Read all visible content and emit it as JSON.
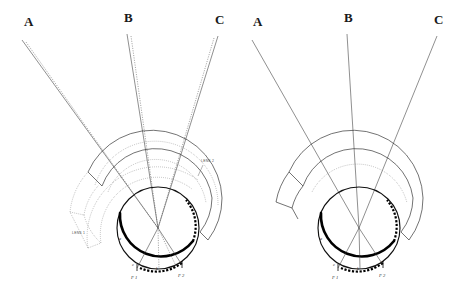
{
  "figure": {
    "background_color": "#ffffff",
    "ink_color": "#111111"
  },
  "panels": [
    {
      "id": "left",
      "name": "panel-with-rotated-lens",
      "ray_labels": [
        {
          "id": "A",
          "text": "A",
          "x": 24,
          "y": 26
        },
        {
          "id": "B",
          "text": "B",
          "x": 124,
          "y": 22
        },
        {
          "id": "C",
          "text": "C",
          "x": 215,
          "y": 24
        }
      ],
      "lens_labels": [
        {
          "id": "lens-2",
          "text": "LENS 2",
          "x": 201,
          "y": 162
        },
        {
          "id": "lens-1",
          "text": "LENS 1",
          "x": 72,
          "y": 234
        }
      ],
      "focus_labels": [
        {
          "id": "F1",
          "text": "F 1",
          "x": 136,
          "y": 277
        },
        {
          "id": "F2",
          "text": "F 2",
          "x": 183,
          "y": 275
        }
      ],
      "retina_marks": [
        {
          "id": "c",
          "text": "c",
          "x": 134,
          "y": 266
        },
        {
          "id": "b",
          "text": "b",
          "x": 158,
          "y": 269
        },
        {
          "id": "d",
          "text": "d",
          "x": 180,
          "y": 264
        },
        {
          "id": "a",
          "text": "a",
          "x": 119,
          "y": 240
        }
      ],
      "nodal_point": {
        "x": 158,
        "y": 228
      },
      "has_dotted_rays": true,
      "has_dotted_lens_sector": true
    },
    {
      "id": "right",
      "name": "panel-with-single-lens",
      "ray_labels": [
        {
          "id": "A",
          "text": "A",
          "x": 19,
          "y": 26
        },
        {
          "id": "B",
          "text": "B",
          "x": 110,
          "y": 22
        },
        {
          "id": "C",
          "text": "C",
          "x": 200,
          "y": 24
        }
      ],
      "lens_labels": [],
      "focus_labels": [
        {
          "id": "F1",
          "text": "F 1",
          "x": 101,
          "y": 277
        },
        {
          "id": "F2",
          "text": "F 2",
          "x": 148,
          "y": 275
        }
      ],
      "retina_marks": [
        {
          "id": "c",
          "text": "c",
          "x": 101,
          "y": 266
        },
        {
          "id": "b",
          "text": "b",
          "x": 125,
          "y": 269
        },
        {
          "id": "d",
          "text": "d",
          "x": 147,
          "y": 264
        },
        {
          "id": "a",
          "text": "a",
          "x": 86,
          "y": 240
        }
      ],
      "nodal_point": {
        "x": 125,
        "y": 228
      },
      "has_dotted_rays": false,
      "has_dotted_lens_sector": false
    }
  ],
  "geometry": {
    "globe_radius": 41,
    "lens_inner_radius": 50,
    "lens_mid_radius": 57,
    "lens_outer_radius": 70,
    "ray_origins": [
      {
        "label": "A",
        "x": 22,
        "y": 40
      },
      {
        "label": "B",
        "x": 127,
        "y": 34
      },
      {
        "label": "C",
        "x": 218,
        "y": 36
      }
    ]
  }
}
